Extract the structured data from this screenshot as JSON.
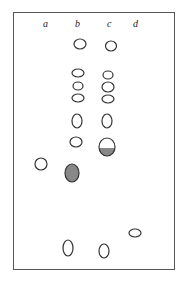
{
  "lanes": [
    {
      "label": "a",
      "x": 46
    },
    {
      "label": "b",
      "x": 78
    },
    {
      "label": "c",
      "x": 110
    },
    {
      "label": "d",
      "x": 136
    }
  ],
  "spots": [
    {
      "lane": "b",
      "cx": 80,
      "cy": 44,
      "rx": 6,
      "ry": 5,
      "fill": "none"
    },
    {
      "lane": "c",
      "cx": 111,
      "cy": 46,
      "rx": 5.5,
      "ry": 5,
      "fill": "none"
    },
    {
      "lane": "b",
      "cx": 78,
      "cy": 73,
      "rx": 6,
      "ry": 4,
      "fill": "none"
    },
    {
      "lane": "b",
      "cx": 78,
      "cy": 86,
      "rx": 5,
      "ry": 4,
      "fill": "none"
    },
    {
      "lane": "b",
      "cx": 78,
      "cy": 98,
      "rx": 6,
      "ry": 4,
      "fill": "none"
    },
    {
      "lane": "c",
      "cx": 108,
      "cy": 75,
      "rx": 5,
      "ry": 4,
      "fill": "none"
    },
    {
      "lane": "c",
      "cx": 108,
      "cy": 87,
      "rx": 6,
      "ry": 5,
      "fill": "none"
    },
    {
      "lane": "c",
      "cx": 108,
      "cy": 99,
      "rx": 6,
      "ry": 4,
      "fill": "none"
    },
    {
      "lane": "b",
      "cx": 77,
      "cy": 121,
      "rx": 5,
      "ry": 7,
      "fill": "none"
    },
    {
      "lane": "c",
      "cx": 107,
      "cy": 121,
      "rx": 5,
      "ry": 7,
      "fill": "none"
    },
    {
      "lane": "b",
      "cx": 76,
      "cy": 142,
      "rx": 6,
      "ry": 5,
      "fill": "none"
    },
    {
      "lane": "c",
      "cx": 107,
      "cy": 147,
      "rx": 8,
      "ry": 9,
      "fill": "partial"
    },
    {
      "lane": "a",
      "cx": 41,
      "cy": 164,
      "rx": 6,
      "ry": 6,
      "fill": "none"
    },
    {
      "lane": "b",
      "cx": 72,
      "cy": 173,
      "rx": 7,
      "ry": 9,
      "fill": "#888888"
    },
    {
      "lane": "d",
      "cx": 135,
      "cy": 233,
      "rx": 6,
      "ry": 4,
      "fill": "none"
    },
    {
      "lane": "a",
      "cx": 68,
      "cy": 248,
      "rx": 5,
      "ry": 8,
      "fill": "none"
    },
    {
      "lane": "b",
      "cx": 104,
      "cy": 251,
      "rx": 5,
      "ry": 7,
      "fill": "none"
    }
  ],
  "colors": {
    "outline": "#333333",
    "shade": "#888888"
  }
}
